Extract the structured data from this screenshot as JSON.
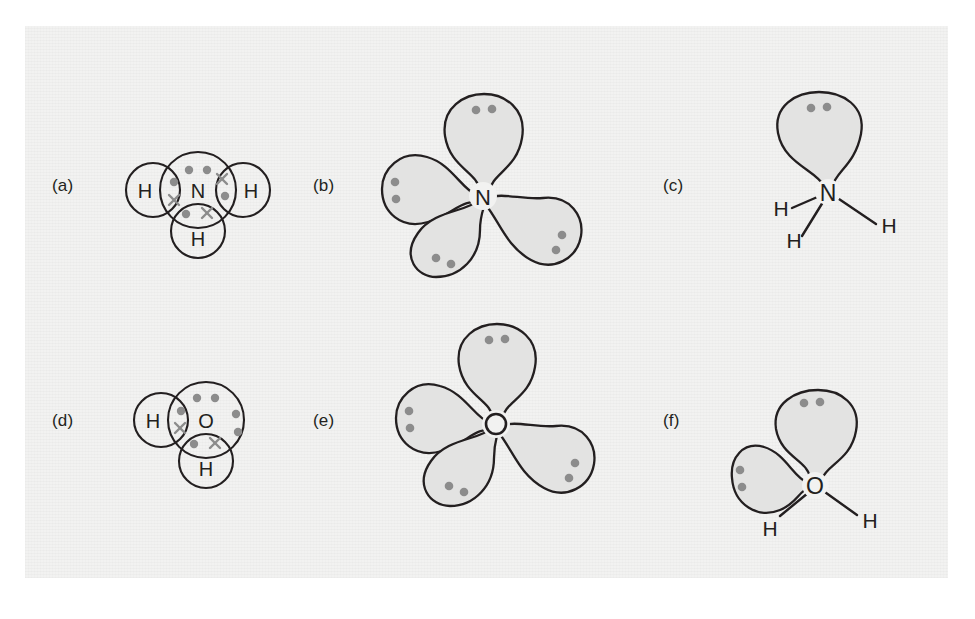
{
  "figure": {
    "background_color": "#f2f2f1",
    "page_color": "#ffffff",
    "line_color": "#231f20",
    "lobe_fill_color": "#e3e3e2",
    "electron_dot_color": "#8c8c8c",
    "cross_color": "#8c8c8c"
  },
  "panels": [
    {
      "id": "a",
      "label": "(a)",
      "type": "dot-and-cross",
      "molecule": "NH3",
      "central_atom": "N",
      "outer_atoms": [
        "H",
        "H",
        "H"
      ],
      "outer_atom_positions": [
        "left",
        "right",
        "bottom"
      ],
      "lone_pairs": 1,
      "bonding_pairs": 3,
      "electron_symbols": [
        "dot",
        "cross"
      ]
    },
    {
      "id": "b",
      "label": "(b)",
      "type": "orbital-lobes",
      "molecule": "NH3",
      "central_atom": "N",
      "lobe_count": 4,
      "electron_pairs_per_lobe": 2,
      "pairs_shown": 4
    },
    {
      "id": "c",
      "label": "(c)",
      "type": "structural",
      "molecule": "NH3",
      "central_atom": "N",
      "outer_atoms": [
        "H",
        "H",
        "H"
      ],
      "lone_pair_lobes": 1,
      "lone_pair_electrons": 2
    },
    {
      "id": "d",
      "label": "(d)",
      "type": "dot-and-cross",
      "molecule": "H2O",
      "central_atom": "O",
      "outer_atoms": [
        "H",
        "H"
      ],
      "outer_atom_positions": [
        "left",
        "bottom"
      ],
      "lone_pairs": 2,
      "bonding_pairs": 2,
      "electron_symbols": [
        "dot",
        "cross"
      ]
    },
    {
      "id": "e",
      "label": "(e)",
      "type": "orbital-lobes",
      "molecule": "H2O",
      "central_atom": "O",
      "lobe_count": 4,
      "electron_pairs_per_lobe": 2,
      "pairs_shown": 4
    },
    {
      "id": "f",
      "label": "(f)",
      "type": "structural",
      "molecule": "H2O",
      "central_atom": "O",
      "outer_atoms": [
        "H",
        "H"
      ],
      "lone_pair_lobes": 2,
      "lone_pair_electrons": 4
    }
  ],
  "atom_labels": {
    "nitrogen": "N",
    "oxygen": "O",
    "hydrogen": "H"
  }
}
